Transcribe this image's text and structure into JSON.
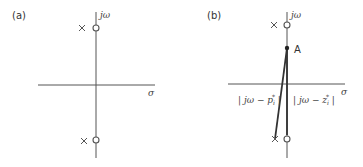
{
  "panels": [
    {
      "label": "(a)",
      "axis_labels": {
        "imag": "jω",
        "real": "σ"
      }
    },
    {
      "label": "(b)",
      "axis_labels": {
        "imag": "jω",
        "real": "σ"
      },
      "point_label": "A",
      "vector_labels": {
        "pole_distance": "| jω − p",
        "pole_distance_sub": "i",
        "pole_distance_sup": "*",
        "zero_distance": "| jω − z",
        "zero_distance_sub": "i",
        "zero_distance_sup": "*"
      }
    }
  ]
}
